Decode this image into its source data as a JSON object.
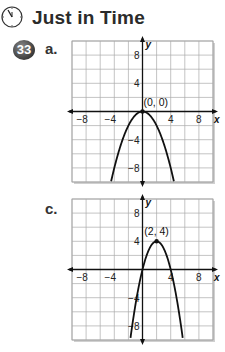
{
  "header": {
    "title": "Just in Time",
    "icon": "clock-icon"
  },
  "problem_number": "33",
  "chart_data": [
    {
      "type": "line",
      "part_label": "a.",
      "title": "",
      "xlabel": "x",
      "ylabel": "y",
      "xlim": [
        -10,
        10
      ],
      "ylim": [
        -10,
        10
      ],
      "grid": true,
      "grid_step": 2,
      "x_tick_labels": [
        "−8",
        "−4",
        "4",
        "8"
      ],
      "x_tick_values": [
        -8,
        -4,
        4,
        8
      ],
      "y_tick_labels": [
        "8",
        "4",
        "−4",
        "−8"
      ],
      "y_tick_values": [
        8,
        4,
        -4,
        -8
      ],
      "series": [
        {
          "name": "parabola",
          "equation": "y = -0.5x^2",
          "a": -0.5,
          "h": 0,
          "k": 0
        }
      ],
      "annotations": [
        {
          "text": "(0, 0)",
          "x": 0,
          "y": 0
        }
      ]
    },
    {
      "type": "line",
      "part_label": "c.",
      "title": "",
      "xlabel": "x",
      "ylabel": "y",
      "xlim": [
        -10,
        10
      ],
      "ylim": [
        -10,
        10
      ],
      "grid": true,
      "grid_step": 2,
      "x_tick_labels": [
        "−8",
        "−4",
        "4",
        "8"
      ],
      "x_tick_values": [
        -8,
        -4,
        4,
        8
      ],
      "y_tick_labels": [
        "8",
        "4",
        "−4",
        "−8"
      ],
      "y_tick_values": [
        8,
        4,
        -4,
        -8
      ],
      "series": [
        {
          "name": "parabola",
          "equation": "y = -(x-2)^2 + 4",
          "a": -1,
          "h": 2,
          "k": 4
        }
      ],
      "annotations": [
        {
          "text": "(2, 4)",
          "x": 2,
          "y": 4
        }
      ]
    }
  ]
}
